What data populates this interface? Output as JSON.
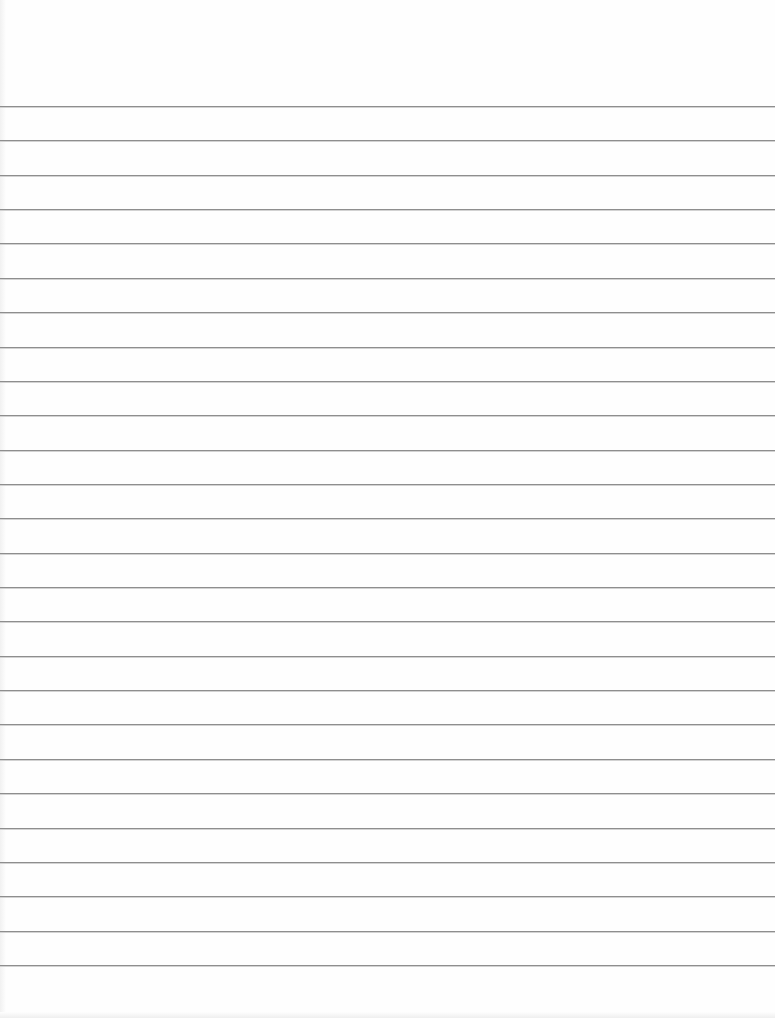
{
  "document": {
    "type": "lined-paper",
    "background_color": "#fefefe",
    "rule_color": "#8e8e8e",
    "rule_count": 26,
    "first_rule_y": 106,
    "rule_spacing": 34.36,
    "text": ""
  }
}
